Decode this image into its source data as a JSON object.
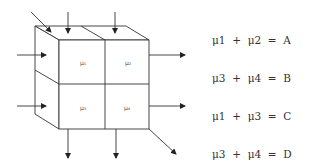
{
  "cube": {
    "cells": [
      {
        "id": "mu1",
        "label": "μ₁"
      },
      {
        "id": "mu2",
        "label": "μ₂"
      },
      {
        "id": "mu3",
        "label": "μ₃"
      },
      {
        "id": "mu4",
        "label": "μ₄"
      }
    ],
    "arrows": {
      "inputs": [
        "diagonal-top-left",
        "top-left-column",
        "top-right-column",
        "left-upper-row",
        "left-lower-row"
      ],
      "outputs": [
        "right-upper-row",
        "right-lower-row",
        "bottom-left-column",
        "bottom-right-column",
        "diagonal-bottom-right"
      ]
    },
    "stroke_color": "#333333"
  },
  "equations": [
    {
      "lhs": "μ1  +  μ2",
      "rhs": "A"
    },
    {
      "lhs": "μ3  +  μ4",
      "rhs": "B"
    },
    {
      "lhs": "μ1  +  μ3",
      "rhs": "C"
    },
    {
      "lhs": "μ3  +  μ4",
      "rhs": "D"
    },
    {
      "lhs": "μ1  +  μ4",
      "rhs": "E"
    }
  ],
  "equation_text": [
    "μ1  +  μ2  =  A",
    "μ3  +  μ4  =  B",
    "μ1  +  μ3  =  C",
    "μ3  +  μ4  =  D",
    "μ1  +  μ4  =  E"
  ]
}
